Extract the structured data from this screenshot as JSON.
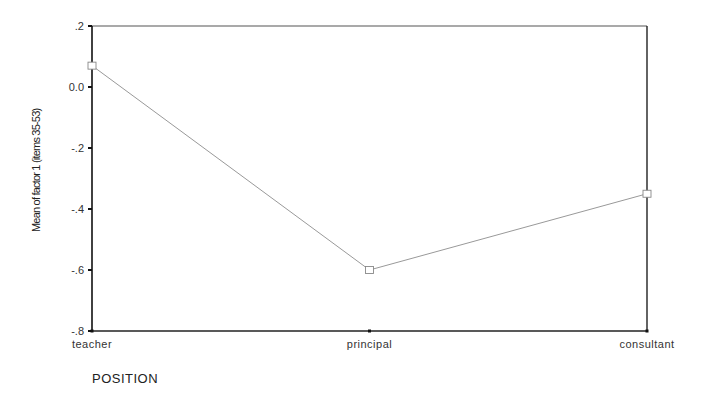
{
  "chart_data": {
    "type": "line",
    "title": "",
    "xlabel": "POSITION",
    "ylabel": "Mean of factor 1 (items 35-53)",
    "categories": [
      "teacher",
      "principal",
      "consultant"
    ],
    "values": [
      0.07,
      -0.6,
      -0.35
    ],
    "ylim": [
      -0.8,
      0.2
    ],
    "yticks": [
      0.2,
      0.0,
      -0.2,
      -0.4,
      -0.6,
      -0.8
    ],
    "ytick_labels": [
      ".2",
      "0.0",
      "-.2",
      "-.4",
      "-.6",
      "-.8"
    ],
    "grid": false,
    "legend": null,
    "marker": "square",
    "line_color": "#999999"
  }
}
